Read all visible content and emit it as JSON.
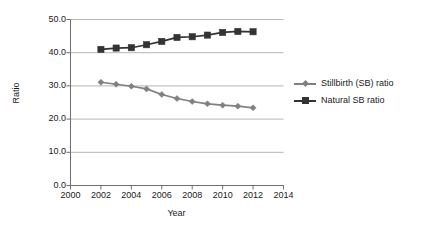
{
  "chart_data": {
    "type": "line",
    "title": "",
    "xlabel": "Year",
    "ylabel": "Ratio",
    "xlim": [
      2000,
      2014
    ],
    "ylim": [
      0.0,
      50.0
    ],
    "grid": true,
    "legend_position": "right",
    "x_ticks": [
      "2000",
      "2002",
      "2004",
      "2006",
      "2008",
      "2010",
      "2012",
      "2014"
    ],
    "x_tick_values": [
      2000,
      2002,
      2004,
      2006,
      2008,
      2010,
      2012,
      2014
    ],
    "y_ticks": [
      "0.0",
      "10.0",
      "20.0",
      "30.0",
      "40.0",
      "50.0"
    ],
    "y_tick_values": [
      0.0,
      10.0,
      20.0,
      30.0,
      40.0,
      50.0
    ],
    "x": [
      2002,
      2003,
      2004,
      2005,
      2006,
      2007,
      2008,
      2009,
      2010,
      2011,
      2012
    ],
    "series": [
      {
        "name": "Stillbirth (SB) ratio",
        "marker": "diamond",
        "color": "#808080",
        "values": [
          31.1,
          30.5,
          29.9,
          29.1,
          27.4,
          26.2,
          25.3,
          24.6,
          24.2,
          23.9,
          23.4
        ]
      },
      {
        "name": "Natural SB ratio",
        "marker": "square",
        "color": "#333333",
        "values": [
          41.0,
          41.4,
          41.5,
          42.4,
          43.4,
          44.6,
          44.8,
          45.3,
          46.1,
          46.4,
          46.3
        ]
      }
    ]
  },
  "axis": {
    "y_title": "Ratio",
    "x_title": "Year"
  },
  "legend": {
    "items": [
      {
        "label": "Stillbirth (SB) ratio"
      },
      {
        "label": "Natural SB ratio"
      }
    ]
  },
  "colors": {
    "series1": "#808080",
    "series2": "#333333",
    "grid": "#b5b5b5",
    "axis": "#6e6e6e",
    "text": "#1a1a1a"
  }
}
